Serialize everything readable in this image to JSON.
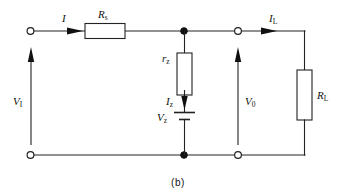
{
  "figure": {
    "caption": "(b)",
    "type": "circuit-schematic"
  },
  "labels": {
    "input_voltage": "V",
    "input_voltage_sub": "I",
    "series_resistor": "R",
    "series_resistor_sub": "s",
    "input_current": "I",
    "zener_resistance": "r",
    "zener_resistance_sub": "z",
    "zener_current": "I",
    "zener_current_sub": "z",
    "zener_voltage": "V",
    "zener_voltage_sub": "z",
    "output_voltage": "V",
    "output_voltage_sub": "0",
    "load_current": "I",
    "load_current_sub": "L",
    "load_resistor": "R",
    "load_resistor_sub": "L"
  },
  "colors": {
    "line": "#222222",
    "fill": "#ffffff",
    "node": "#111111",
    "background": "#ffffff"
  }
}
